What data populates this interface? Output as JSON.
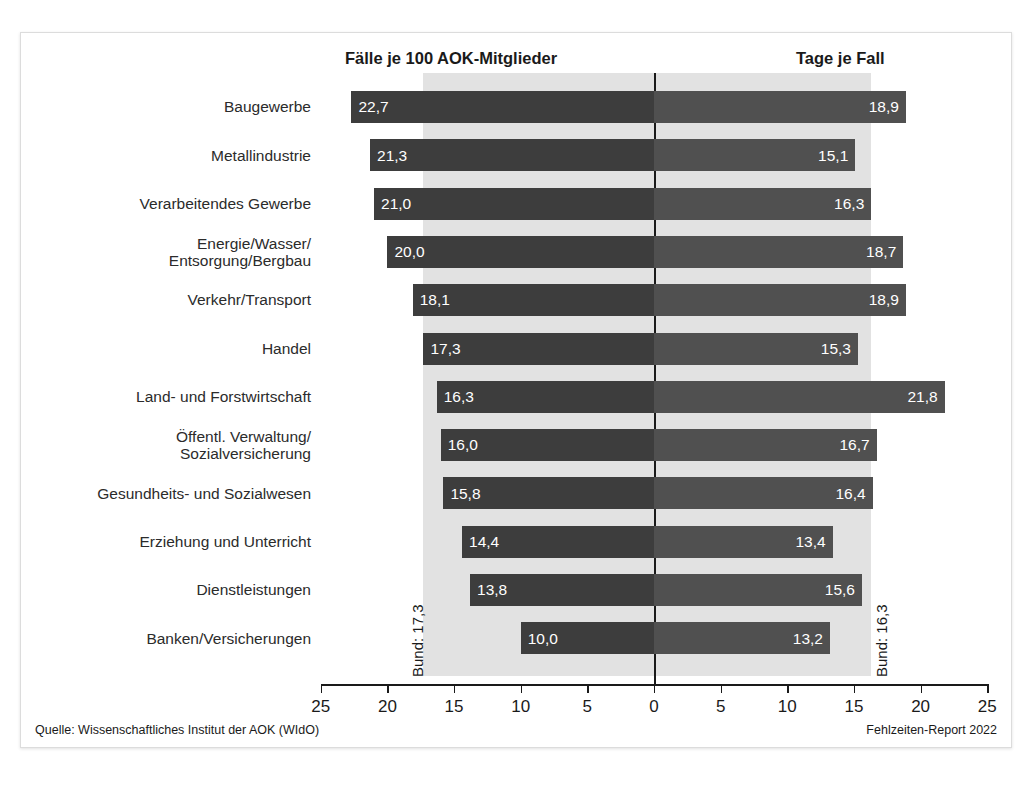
{
  "headers": {
    "left": "Fälle je 100 AOK-Mitglieder",
    "right": "Tage je Fall"
  },
  "footer": {
    "source": "Quelle: Wissenschaftliches Institut der AOK (WIdO)",
    "report": "Fehlzeiten-Report 2022"
  },
  "reference": {
    "left_label": "Bund: 17,3",
    "right_label": "Bund: 16,3",
    "left_value": 17.3,
    "right_value": 16.3
  },
  "colors": {
    "bar_left": "#3d3d3d",
    "bar_right": "#505050",
    "band": "#e2e2e2",
    "axis": "#1a1a1a",
    "text": "#1a1a1a",
    "frame": "#dcdcdc"
  },
  "axis": {
    "ticks": [
      "25",
      "20",
      "15",
      "10",
      "5",
      "0",
      "5",
      "10",
      "15",
      "20",
      "25"
    ],
    "tick_values": [
      -25,
      -20,
      -15,
      -10,
      -5,
      0,
      5,
      10,
      15,
      20,
      25
    ],
    "max": 25
  },
  "chart_data": {
    "type": "bar",
    "title": "",
    "subtitle": "",
    "orientation": "horizontal",
    "layout": "diverging-bidirectional",
    "xlabel": "",
    "ylabel": "",
    "xlim": [
      -25,
      25
    ],
    "grid": false,
    "legend": "none",
    "categories": [
      "Baugewerbe",
      "Metallindustrie",
      "Verarbeitendes Gewerbe",
      "Energie/Wasser/\nEntsorgung/Bergbau",
      "Verkehr/Transport",
      "Handel",
      "Land- und Forstwirtschaft",
      "Öffentl. Verwaltung/\nSozialversicherung",
      "Gesundheits- und Sozialwesen",
      "Erziehung und Unterricht",
      "Dienstleistungen",
      "Banken/Versicherungen"
    ],
    "series": [
      {
        "name": "Fälle je 100 AOK-Mitglieder",
        "side": "left",
        "values": [
          22.7,
          21.3,
          21.0,
          20.0,
          18.1,
          17.3,
          16.3,
          16.0,
          15.8,
          14.4,
          13.8,
          10.0
        ],
        "labels": [
          "22,7",
          "21,3",
          "21,0",
          "20,0",
          "18,1",
          "17,3",
          "16,3",
          "16,0",
          "15,8",
          "14,4",
          "13,8",
          "10,0"
        ],
        "reference_line": 17.3,
        "reference_label": "Bund: 17,3"
      },
      {
        "name": "Tage je Fall",
        "side": "right",
        "values": [
          18.9,
          15.1,
          16.3,
          18.7,
          18.9,
          15.3,
          21.8,
          16.7,
          16.4,
          13.4,
          15.6,
          13.2
        ],
        "labels": [
          "18,9",
          "15,1",
          "16,3",
          "18,7",
          "18,9",
          "15,3",
          "21,8",
          "16,7",
          "16,4",
          "13,4",
          "15,6",
          "13,2"
        ],
        "reference_line": 16.3,
        "reference_label": "Bund: 16,3"
      }
    ],
    "source": "Quelle: Wissenschaftliches Institut der AOK (WIdO)",
    "note": "Fehlzeiten-Report 2022"
  }
}
